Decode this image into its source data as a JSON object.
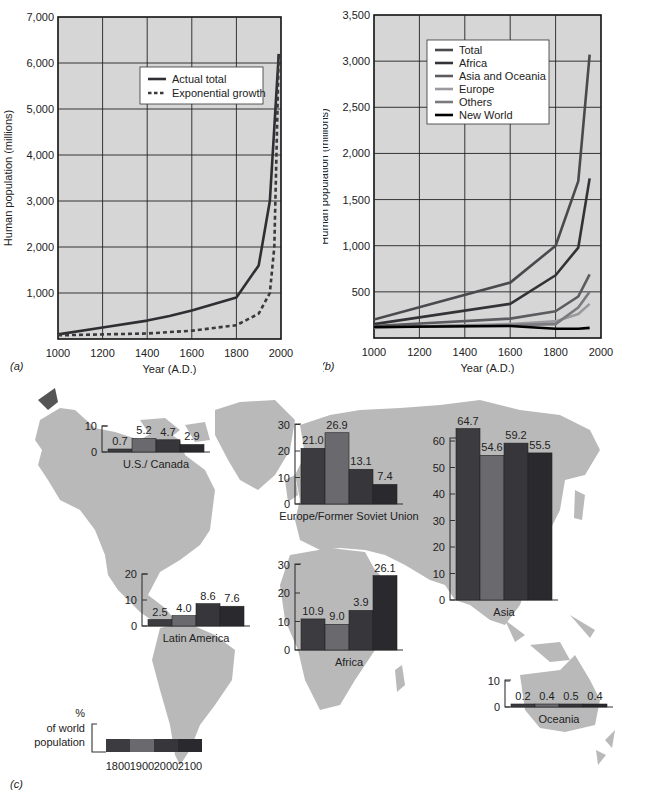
{
  "panels": {
    "a": {
      "label": "(a)"
    },
    "b": {
      "label": "(b)"
    },
    "c": {
      "label": "(c)"
    }
  },
  "colors": {
    "plot_bg": "#d6d6d6",
    "grid": "#222222",
    "land": "#b9b9b9",
    "bar_1800": "#3c3c40",
    "bar_1900": "#6a6a6e",
    "bar_2000": "#37373b",
    "bar_2100": "#2a2a2e",
    "total": "#4a4a4e",
    "africa": "#333337",
    "asia_oceania": "#5c5c60",
    "europe": "#9a9a9e",
    "others": "#7a7a7e",
    "new_world": "#000000"
  },
  "chart_data": [
    {
      "id": "a",
      "type": "line",
      "title": "",
      "xlabel": "Year (A.D.)",
      "ylabel": "Human population (millions)",
      "xlim": [
        1000,
        2000
      ],
      "ylim": [
        0,
        7000
      ],
      "xticks": [
        "1000",
        "1200",
        "1400",
        "1600",
        "1800",
        "2000"
      ],
      "yticks": [
        "1,000",
        "2,000",
        "3,000",
        "4,000",
        "5,000",
        "6,000",
        "7,000"
      ],
      "grid": true,
      "legend_position": "upper-center-right",
      "series": [
        {
          "name": "Actual total",
          "style": "solid",
          "x": [
            1000,
            1200,
            1400,
            1500,
            1600,
            1800,
            1900,
            1950,
            1990
          ],
          "y": [
            100,
            250,
            400,
            500,
            620,
            900,
            1600,
            3000,
            6200
          ]
        },
        {
          "name": "Exponential growth",
          "style": "dashed",
          "x": [
            1000,
            1200,
            1400,
            1600,
            1800,
            1900,
            1950,
            1970,
            1990
          ],
          "y": [
            80,
            100,
            120,
            180,
            300,
            550,
            1000,
            2000,
            6200
          ]
        }
      ]
    },
    {
      "id": "b",
      "type": "line",
      "title": "",
      "xlabel": "Year (A.D.)",
      "ylabel": "Human population (millions)",
      "xlim": [
        1000,
        2000
      ],
      "ylim": [
        0,
        3500
      ],
      "xticks": [
        "1000",
        "1200",
        "1400",
        "1600",
        "1800",
        "2000"
      ],
      "yticks": [
        "500",
        "1,000",
        "1,500",
        "2,000",
        "2,500",
        "3,000",
        "3,500"
      ],
      "grid": true,
      "legend_position": "upper-left-center",
      "series": [
        {
          "name": "Total",
          "x": [
            1000,
            1600,
            1800,
            1900,
            1950
          ],
          "y": [
            200,
            600,
            1000,
            1700,
            3070
          ]
        },
        {
          "name": "Africa",
          "x": [
            1000,
            1600,
            1800,
            1900,
            1950
          ],
          "y": [
            150,
            370,
            680,
            980,
            1730
          ]
        },
        {
          "name": "Asia and Oceania",
          "x": [
            1000,
            1600,
            1800,
            1900,
            1950
          ],
          "y": [
            130,
            210,
            290,
            450,
            690
          ]
        },
        {
          "name": "Europe",
          "x": [
            1000,
            1600,
            1800,
            1900,
            1950
          ],
          "y": [
            110,
            150,
            180,
            260,
            370
          ]
        },
        {
          "name": "Others",
          "x": [
            1000,
            1600,
            1800,
            1900,
            1950
          ],
          "y": [
            120,
            140,
            150,
            330,
            500
          ]
        },
        {
          "name": "New World",
          "x": [
            1000,
            1600,
            1800,
            1900,
            1950
          ],
          "y": [
            120,
            130,
            100,
            100,
            110
          ]
        }
      ]
    },
    {
      "id": "c",
      "type": "bar",
      "title": "",
      "ylabel": "% of world population",
      "categories": [
        "1800",
        "1900",
        "2000",
        "2100"
      ],
      "legend": {
        "label_line1": "%",
        "label_line2": "of world",
        "label_line3": "population"
      },
      "regions": [
        {
          "name": "U.S./ Canada",
          "values": [
            0.7,
            5.2,
            4.7,
            2.9
          ],
          "labels": [
            "0.7",
            "5.2",
            "4.7",
            "2.9"
          ],
          "ymax": 10,
          "yticks": [
            "0",
            "10"
          ]
        },
        {
          "name": "Europe/Former Soviet Union",
          "values": [
            21.0,
            26.9,
            13.1,
            7.4
          ],
          "labels": [
            "21.0",
            "26.9",
            "13.1",
            "7.4"
          ],
          "ymax": 30,
          "yticks": [
            "0",
            "10",
            "20",
            "30"
          ]
        },
        {
          "name": "Asia",
          "values": [
            64.7,
            54.6,
            59.2,
            55.5
          ],
          "labels": [
            "64.7",
            "54.6",
            "59.2",
            "55.5"
          ],
          "ymax": 60,
          "yticks": [
            "0",
            "10",
            "20",
            "30",
            "40",
            "50",
            "60"
          ]
        },
        {
          "name": "Africa",
          "values": [
            10.9,
            9.0,
            13.9,
            26.1
          ],
          "labels": [
            "10.9",
            "9.0",
            "3.9",
            "26.1"
          ],
          "ymax": 30,
          "yticks": [
            "0",
            "10",
            "20",
            "30"
          ]
        },
        {
          "name": "Latin America",
          "values": [
            2.5,
            4.0,
            8.6,
            7.6
          ],
          "labels": [
            "2.5",
            "4.0",
            "8.6",
            "7.6"
          ],
          "ymax": 20,
          "yticks": [
            "0",
            "10",
            "20"
          ]
        },
        {
          "name": "Oceania",
          "values": [
            0.2,
            0.4,
            0.5,
            0.4
          ],
          "labels": [
            "0.2",
            "0.4",
            "0.5",
            "0.4"
          ],
          "ymax": 10,
          "yticks": [
            "0",
            "10"
          ]
        }
      ]
    }
  ]
}
